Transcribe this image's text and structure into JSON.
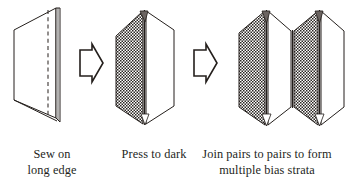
{
  "diagram": {
    "ink_color": "#241f1c",
    "fill_light": "#ffffff",
    "fill_dark_pattern": "stipple-dots",
    "steps": [
      {
        "id": "step-1",
        "caption_line1": "Sew on",
        "caption_line2": "long edge",
        "figure_name": "single-bias-strip-with-seam-line",
        "panels": 1,
        "seam": "dashed-vertical"
      },
      {
        "id": "step-2",
        "caption_line1": "Press to dark",
        "caption_line2": "",
        "figure_name": "pressed-pair-dark-and-light",
        "panels": 2,
        "seam": "solid-center-fold"
      },
      {
        "id": "step-3",
        "caption_line1": "Join pairs to pairs to form",
        "caption_line2": "multiple bias strata",
        "figure_name": "four-panel-bias-strata",
        "panels": 4,
        "seam": "solid-folds"
      }
    ],
    "arrows": [
      {
        "id": "arrow-1",
        "label": "then",
        "direction": "right"
      },
      {
        "id": "arrow-2",
        "label": "then",
        "direction": "right"
      }
    ]
  }
}
